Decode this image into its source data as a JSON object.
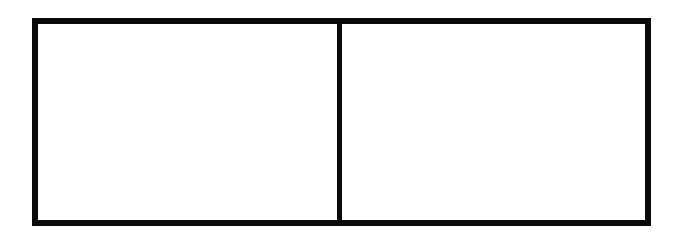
{
  "diagram": {
    "type": "two-panel-box",
    "panels": [
      {
        "id": "left",
        "label": ""
      },
      {
        "id": "right",
        "label": ""
      }
    ],
    "colors": {
      "border": "#0a0a0a",
      "fill": "#ffffff",
      "background": "#ffffff"
    }
  }
}
